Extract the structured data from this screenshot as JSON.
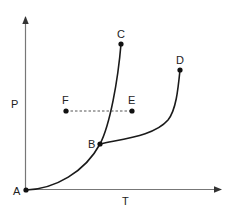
{
  "diagram": {
    "type": "phase-diagram",
    "axes": {
      "x_label": "T",
      "y_label": "P"
    },
    "points": {
      "A": {
        "label": "A"
      },
      "B": {
        "label": "B"
      },
      "C": {
        "label": "C"
      },
      "D": {
        "label": "D"
      },
      "E": {
        "label": "E"
      },
      "F": {
        "label": "F"
      }
    },
    "curves": [
      {
        "from": "A",
        "to": "B",
        "style": "solid"
      },
      {
        "from": "B",
        "to": "C",
        "style": "solid"
      },
      {
        "from": "B",
        "to": "D",
        "style": "solid"
      },
      {
        "from": "F",
        "to": "E",
        "style": "dashed"
      }
    ],
    "colors": {
      "axis": "#777777",
      "curve": "#1a1a1a",
      "dashed": "#555555",
      "text": "#222222"
    }
  }
}
